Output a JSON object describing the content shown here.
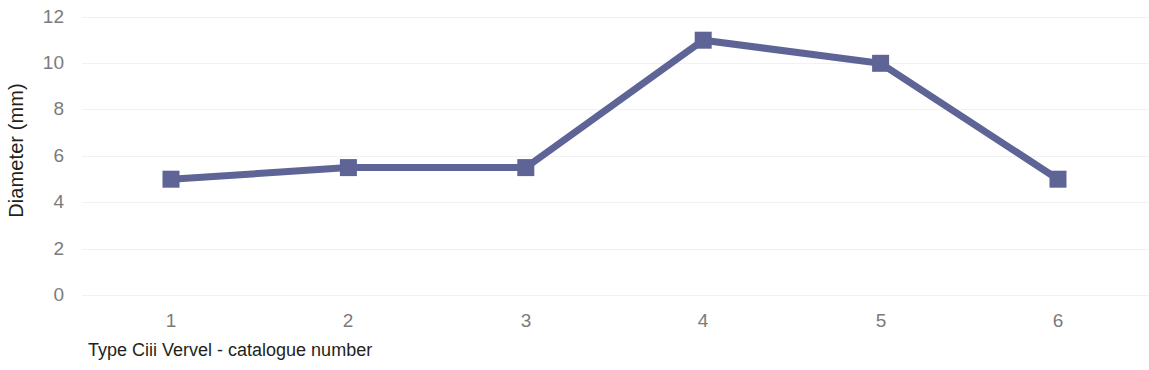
{
  "chart_data": {
    "type": "line",
    "title": "",
    "subtitle": "",
    "xlabel": "Type Ciii Vervel - catalogue number",
    "ylabel": "Diameter (mm)",
    "categories": [
      "1",
      "2",
      "3",
      "4",
      "5",
      "6"
    ],
    "x": [
      1,
      2,
      3,
      4,
      5,
      6
    ],
    "values": [
      5,
      5.5,
      5.5,
      11,
      10,
      5
    ],
    "series": [
      {
        "name": "Diameter",
        "values": [
          5,
          5.5,
          5.5,
          11,
          10,
          5
        ]
      }
    ],
    "xlim": [
      0.5,
      6.5
    ],
    "ylim": [
      0,
      12
    ],
    "y_ticks": [
      0,
      2,
      4,
      6,
      8,
      10,
      12
    ],
    "x_ticks": [
      1,
      2,
      3,
      4,
      5,
      6
    ],
    "grid": "horizontal-only",
    "legend": "none",
    "marker": "square",
    "colors": {
      "series_line": "#5e6496",
      "series_marker": "#5e6496",
      "gridline": "#f1f1f3",
      "tick_label": "#7b7b7b",
      "axis_title": "#231f20",
      "background": "#ffffff"
    }
  },
  "axes": {
    "y_tick_labels": [
      "12",
      "10",
      "8",
      "6",
      "4",
      "2",
      "0"
    ],
    "x_tick_labels": [
      "1",
      "2",
      "3",
      "4",
      "5",
      "6"
    ],
    "y_title": "Diameter (mm)",
    "x_title": "Type Ciii Vervel - catalogue number"
  }
}
